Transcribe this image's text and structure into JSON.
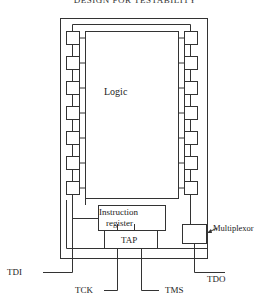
{
  "title": "DESIGN FOR TESTABILITY",
  "diagram": {
    "blocks": {
      "logic": "Logic",
      "instruction_register_line1": "Instruction",
      "instruction_register_line2": "register",
      "tap": "TAP",
      "multiplexor": "Multiplexor"
    },
    "signals": {
      "tdi": "TDI",
      "tck": "TCK",
      "tms": "TMS",
      "tdo": "TDO"
    },
    "boundary_scan_cells_per_side": 7,
    "colors": {
      "line": "#333333",
      "background": "#ffffff"
    }
  }
}
